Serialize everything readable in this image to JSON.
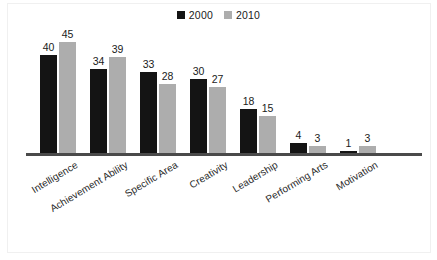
{
  "chart_data": {
    "type": "bar",
    "title": "",
    "subtitle": "",
    "xlabel": "",
    "ylabel": "",
    "ylim": [
      0,
      50
    ],
    "grid": false,
    "legend_position": "top-center",
    "categories": [
      "Intelligence",
      "Achievement Ability",
      "Specific Area",
      "Creativity",
      "Leadership",
      "Performing Arts",
      "Motivation"
    ],
    "series": [
      {
        "name": "2000",
        "color": "#141414",
        "values": [
          40,
          34,
          33,
          30,
          18,
          4,
          1
        ]
      },
      {
        "name": "2010",
        "color": "#adadad",
        "values": [
          45,
          39,
          28,
          27,
          15,
          3,
          3
        ]
      }
    ],
    "data_labels": true,
    "axis_color": "#4a4a4a"
  },
  "legend": {
    "items": [
      {
        "label": "2000",
        "color": "#141414",
        "swatch": "legend-swatch-2000"
      },
      {
        "label": "2010",
        "color": "#adadad",
        "swatch": "legend-swatch-2010"
      }
    ]
  }
}
